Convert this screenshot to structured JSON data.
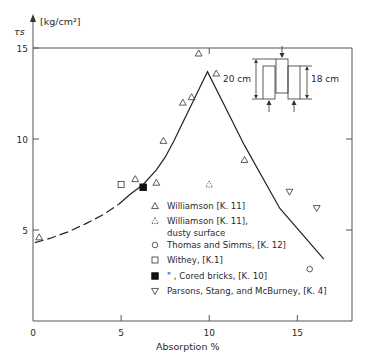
{
  "chart_data": {
    "type": "scatter",
    "title": "",
    "xlabel": "Absorption %",
    "ylabel": "τs",
    "yunit": "[kg/cm²]",
    "xlim": [
      0,
      18.1
    ],
    "ylim": [
      0,
      15
    ],
    "xticks": [
      0,
      5,
      10,
      15
    ],
    "yticks": [
      5,
      10,
      15
    ],
    "xtick_labels": [
      "0",
      "5",
      "10",
      "15"
    ],
    "ytick_labels": [
      "5",
      "10",
      "15"
    ],
    "grid": false,
    "legend_position": "bottom-right",
    "series": [
      {
        "name": "Williamson [K. 11]",
        "marker": "triangle",
        "points": [
          [
            0.35,
            4.6
          ],
          [
            5.8,
            7.8
          ],
          [
            7.0,
            7.6
          ],
          [
            7.4,
            9.9
          ],
          [
            8.5,
            12.0
          ],
          [
            9.0,
            12.3
          ],
          [
            9.4,
            14.7
          ],
          [
            10.4,
            13.6
          ],
          [
            12.0,
            8.85
          ]
        ]
      },
      {
        "name": "Williamson [K. 11], dusty surface",
        "marker": "dotted-triangle",
        "points": [
          [
            10.0,
            7.5
          ]
        ]
      },
      {
        "name": "Thomas and Simms, [K. 12]",
        "marker": "circle",
        "points": [
          [
            15.7,
            2.85
          ]
        ]
      },
      {
        "name": "Withey, [K.1]",
        "marker": "square",
        "points": [
          [
            5.0,
            7.5
          ]
        ]
      },
      {
        "name": "\" , Cored bricks, [K. 10]",
        "marker": "filled-square",
        "points": [
          [
            6.25,
            7.35
          ]
        ]
      },
      {
        "name": "Parsons, Stang, and McBurney, [K. 4]",
        "marker": "inverted-triangle",
        "points": [
          [
            14.55,
            7.1
          ],
          [
            16.1,
            6.2
          ]
        ]
      }
    ],
    "fit_curve": {
      "dashed": [
        [
          0.1,
          4.3
        ],
        [
          1.0,
          4.55
        ],
        [
          2.0,
          4.9
        ],
        [
          3.0,
          5.35
        ],
        [
          4.0,
          5.85
        ],
        [
          4.85,
          6.4
        ]
      ],
      "solid": [
        [
          4.85,
          6.4
        ],
        [
          5.5,
          6.95
        ],
        [
          6.25,
          7.5
        ],
        [
          7.0,
          8.3
        ],
        [
          7.5,
          9.0
        ],
        [
          8.0,
          9.9
        ],
        [
          8.5,
          10.9
        ],
        [
          9.0,
          11.9
        ],
        [
          9.5,
          12.9
        ],
        [
          9.9,
          13.7
        ],
        [
          12.0,
          9.65
        ],
        [
          14.0,
          6.2
        ],
        [
          16.5,
          3.4
        ]
      ]
    },
    "inset": {
      "label_left": "20 cm",
      "label_right": "18 cm"
    },
    "legend": [
      {
        "label": "Williamson [K. 11]",
        "marker": "triangle"
      },
      {
        "label": "Williamson [K. 11],",
        "label2": "dusty surface",
        "marker": "dotted-triangle"
      },
      {
        "label": "Thomas and Simms, [K. 12]",
        "marker": "circle"
      },
      {
        "label": "Withey, [K.1]",
        "marker": "square"
      },
      {
        "label": "\"       , Cored bricks, [K. 10]",
        "marker": "filled-square"
      },
      {
        "label": "Parsons, Stang, and McBurney, [K. 4]",
        "marker": "inverted-triangle"
      }
    ]
  }
}
